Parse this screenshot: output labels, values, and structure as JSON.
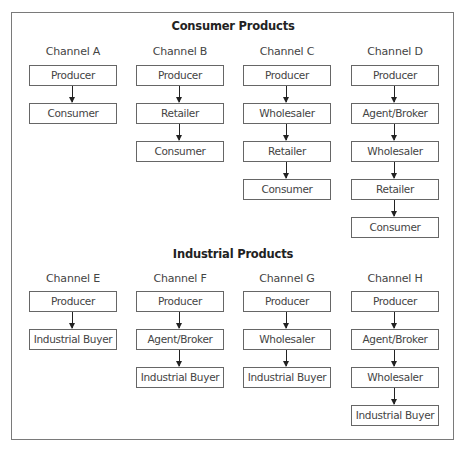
{
  "sections": [
    {
      "title": "Consumer Products",
      "channels": [
        {
          "label": "Channel A",
          "steps": [
            "Producer",
            "Consumer"
          ]
        },
        {
          "label": "Channel B",
          "steps": [
            "Producer",
            "Retailer",
            "Consumer"
          ]
        },
        {
          "label": "Channel C",
          "steps": [
            "Producer",
            "Wholesaler",
            "Retailer",
            "Consumer"
          ]
        },
        {
          "label": "Channel D",
          "steps": [
            "Producer",
            "Agent/Broker",
            "Wholesaler",
            "Retailer",
            "Consumer"
          ]
        }
      ]
    },
    {
      "title": "Industrial Products",
      "channels": [
        {
          "label": "Channel E",
          "steps": [
            "Producer",
            "Industrial Buyer"
          ]
        },
        {
          "label": "Channel F",
          "steps": [
            "Producer",
            "Agent/Broker",
            "Industrial Buyer"
          ]
        },
        {
          "label": "Channel G",
          "steps": [
            "Producer",
            "Wholesaler",
            "Industrial Buyer"
          ]
        },
        {
          "label": "Channel H",
          "steps": [
            "Producer",
            "Agent/Broker",
            "Wholesaler",
            "Industrial Buyer"
          ]
        }
      ]
    }
  ]
}
